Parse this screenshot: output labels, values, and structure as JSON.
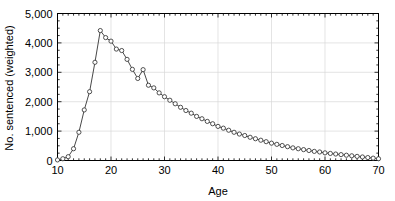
{
  "chart_data": {
    "type": "line",
    "title": "",
    "xlabel": "Age",
    "ylabel": "No. sentenced (weighted)",
    "xlim": [
      10,
      70
    ],
    "ylim": [
      0,
      5000
    ],
    "grid": true,
    "legend": "none",
    "marker": "open-circle",
    "line_color": "#333333",
    "marker_color": "#333333",
    "grid_color": "#d9d9d9",
    "axis_color": "#000000",
    "background_color": "#ffffff",
    "xticks": [
      10,
      20,
      30,
      40,
      50,
      60,
      70
    ],
    "xtick_labels": [
      "10",
      "20",
      "30",
      "40",
      "50",
      "60",
      "70"
    ],
    "yticks": [
      0,
      1000,
      2000,
      3000,
      4000,
      5000
    ],
    "ytick_labels": [
      "0",
      "1,000",
      "2,000",
      "3,000",
      "4,000",
      "5,000"
    ],
    "x": [
      10,
      11,
      12,
      13,
      14,
      15,
      16,
      17,
      18,
      19,
      20,
      21,
      22,
      23,
      24,
      25,
      26,
      27,
      28,
      29,
      30,
      31,
      32,
      33,
      34,
      35,
      36,
      37,
      38,
      39,
      40,
      41,
      42,
      43,
      44,
      45,
      46,
      47,
      48,
      49,
      50,
      51,
      52,
      53,
      54,
      55,
      56,
      57,
      58,
      59,
      60,
      61,
      62,
      63,
      64,
      65,
      66,
      67,
      68,
      69,
      70
    ],
    "values": [
      20,
      60,
      130,
      400,
      960,
      1720,
      2340,
      3340,
      4420,
      4180,
      4060,
      3790,
      3740,
      3440,
      3100,
      2790,
      3090,
      2560,
      2470,
      2300,
      2170,
      2050,
      1930,
      1810,
      1700,
      1610,
      1500,
      1420,
      1330,
      1250,
      1160,
      1100,
      1030,
      960,
      900,
      850,
      790,
      740,
      690,
      640,
      590,
      550,
      510,
      470,
      430,
      400,
      370,
      340,
      310,
      290,
      260,
      240,
      220,
      200,
      180,
      160,
      140,
      120,
      100,
      80,
      60
    ]
  },
  "axis": {
    "x_title": "Age",
    "y_title": "No. sentenced (weighted)"
  }
}
